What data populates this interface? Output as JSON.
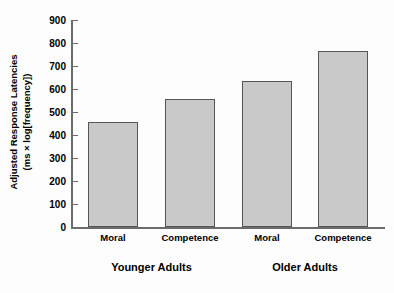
{
  "chart_data": {
    "type": "bar",
    "title": "",
    "xlabel": "",
    "ylabel_line1": "Adjusted Response Latencies",
    "ylabel_line2": "(ms × log[frequency])",
    "categories": [
      "Moral",
      "Competence",
      "Moral",
      "Competence"
    ],
    "values": [
      457,
      557,
      635,
      765
    ],
    "groups": [
      {
        "label": "Younger Adults",
        "categories": [
          "Moral",
          "Competence"
        ],
        "values": [
          457,
          557
        ]
      },
      {
        "label": "Older Adults",
        "categories": [
          "Moral",
          "Competence"
        ],
        "values": [
          635,
          765
        ]
      }
    ],
    "ylim": [
      0,
      900
    ],
    "ytick_values": [
      0,
      100,
      200,
      300,
      400,
      500,
      600,
      700,
      800,
      900
    ],
    "ytick_labels": [
      "0",
      "100",
      "200",
      "300",
      "400",
      "500",
      "600",
      "700",
      "800",
      "900"
    ],
    "grid": false,
    "legend": null,
    "bar_fill_color": "#c9c9c9",
    "bar_edge_color": "#555555",
    "axis_color": "#6b6b6b",
    "background_color": "#fdfdfd"
  }
}
